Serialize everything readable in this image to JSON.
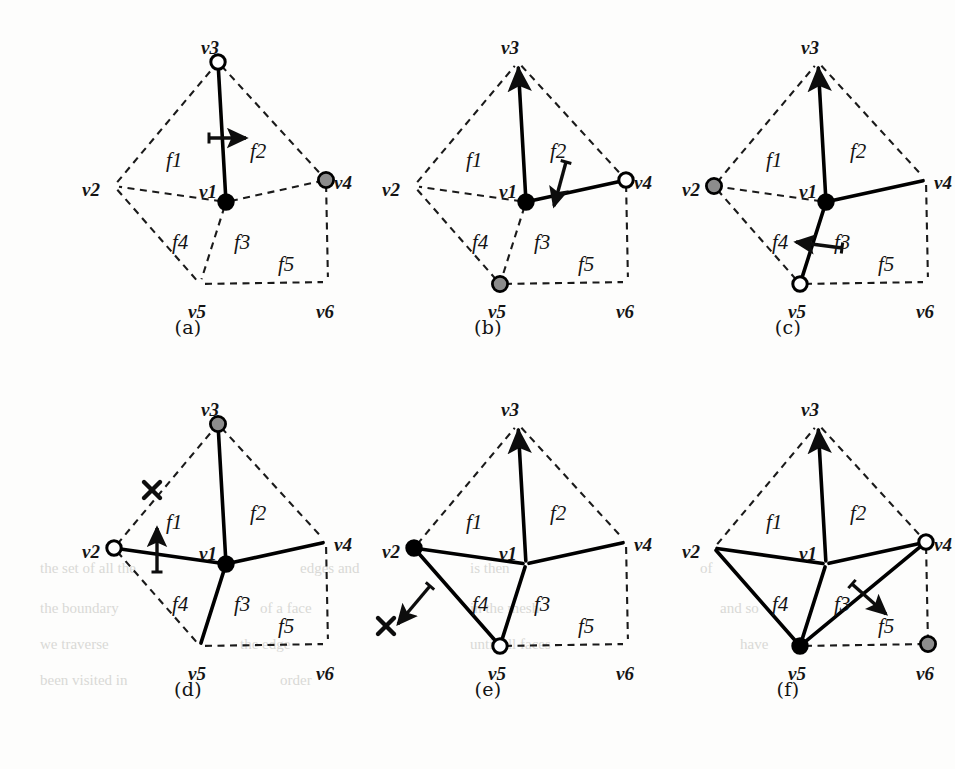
{
  "figure": {
    "vertex_names": [
      "v1",
      "v2",
      "v3",
      "v4",
      "v5",
      "v6"
    ],
    "face_names": [
      "f1",
      "f2",
      "f3",
      "f4",
      "f5"
    ],
    "colors": {
      "ink": "#141414",
      "dashed_edge": "#1a1a1a",
      "solid_edge": "#000000",
      "vertex_black": "#000000",
      "vertex_gray": "#8c8c8c",
      "vertex_white": "#ffffff",
      "background": "#fdfdfc"
    },
    "legend_semantics": {
      "black_filled": "current vertex",
      "gray_filled": "queued vertex",
      "white_open": "finished vertex",
      "dashed": "untraversed edge",
      "solid": "traversed edge",
      "arrow": "traversal direction",
      "cross": "rejected / blocked"
    },
    "geometry": {
      "v1": [
        188,
        192
      ],
      "v2": [
        76,
        176
      ],
      "v3": [
        180,
        52
      ],
      "v4": [
        288,
        170
      ],
      "v5": [
        162,
        274
      ],
      "v6": [
        290,
        272
      ]
    },
    "face_label_pos": {
      "f1": [
        128,
        140
      ],
      "f2": [
        212,
        131
      ],
      "f3": [
        196,
        222
      ],
      "f4": [
        134,
        222
      ],
      "f5": [
        240,
        244
      ]
    },
    "vertex_label_pos": {
      "v1": [
        161,
        172
      ],
      "v2": [
        44,
        170
      ],
      "v3": [
        163,
        28
      ],
      "v4": [
        296,
        163
      ],
      "v5": [
        150,
        292
      ],
      "v6": [
        278,
        292
      ]
    }
  },
  "panels": [
    {
      "id": "a",
      "caption": "(a)",
      "x": 38,
      "y": 10,
      "vertex_markers": {
        "v1": "black",
        "v2": "none",
        "v3": "white",
        "v4": "gray",
        "v5": "none",
        "v6": "none"
      },
      "solid_edges": [
        "v1-v3"
      ],
      "dashed_edges": [
        "v2-v3",
        "v3-v4",
        "v1-v2",
        "v1-v4",
        "v1-v5",
        "v2-v5",
        "v5-v6",
        "v4-v6"
      ],
      "arrow": {
        "x1": 171,
        "y1": 128,
        "x2": 208,
        "y2": 128,
        "label": "right"
      },
      "cross": null
    },
    {
      "id": "b",
      "caption": "(b)",
      "x": 338,
      "y": 10,
      "vertex_markers": {
        "v1": "black",
        "v2": "none",
        "v3": "arrowtip",
        "v4": "white",
        "v5": "gray",
        "v6": "none"
      },
      "solid_edges": [
        "v1-v3",
        "v1-v4"
      ],
      "dashed_edges": [
        "v2-v3",
        "v3-v4",
        "v1-v2",
        "v1-v5",
        "v2-v5",
        "v5-v6",
        "v4-v6"
      ],
      "arrow": {
        "x1": 228,
        "y1": 152,
        "x2": 216,
        "y2": 196,
        "label": "down"
      },
      "cross": null
    },
    {
      "id": "c",
      "caption": "(c)",
      "x": 638,
      "y": 10,
      "vertex_markers": {
        "v1": "black",
        "v2": "gray",
        "v3": "arrowtip",
        "v4": "none",
        "v5": "white",
        "v6": "none"
      },
      "solid_edges": [
        "v1-v3",
        "v1-v4",
        "v1-v5"
      ],
      "dashed_edges": [
        "v2-v3",
        "v3-v4",
        "v1-v2",
        "v2-v5",
        "v5-v6",
        "v4-v6"
      ],
      "arrow": {
        "x1": 204,
        "y1": 238,
        "x2": 158,
        "y2": 232,
        "label": "left"
      },
      "cross": null
    },
    {
      "id": "d",
      "caption": "(d)",
      "x": 38,
      "y": 372,
      "vertex_markers": {
        "v1": "black",
        "v2": "white",
        "v3": "gray",
        "v4": "none",
        "v5": "none",
        "v6": "none"
      },
      "solid_edges": [
        "v1-v3",
        "v1-v4",
        "v1-v5",
        "v1-v2"
      ],
      "dashed_edges": [
        "v2-v3",
        "v3-v4",
        "v2-v5",
        "v5-v6",
        "v4-v6"
      ],
      "arrow": {
        "x1": 119,
        "y1": 200,
        "x2": 119,
        "y2": 156,
        "label": "up"
      },
      "cross": {
        "x": 114,
        "y": 118
      }
    },
    {
      "id": "e",
      "caption": "(e)",
      "x": 338,
      "y": 372,
      "vertex_markers": {
        "v1": "none",
        "v2": "black",
        "v3": "arrowtip",
        "v4": "none",
        "v5": "white",
        "v6": "none"
      },
      "solid_edges": [
        "v1-v3",
        "v1-v4",
        "v1-v5",
        "v1-v2",
        "v2-v5"
      ],
      "dashed_edges": [
        "v2-v3",
        "v3-v4",
        "v5-v6",
        "v4-v6"
      ],
      "arrow": {
        "x1": 92,
        "y1": 214,
        "x2": 60,
        "y2": 252,
        "label": "down-left"
      },
      "cross": {
        "x": 48,
        "y": 254
      }
    },
    {
      "id": "f",
      "caption": "(f)",
      "x": 638,
      "y": 372,
      "vertex_markers": {
        "v1": "none",
        "v2": "none",
        "v3": "arrowtip",
        "v4": "white",
        "v5": "black",
        "v6": "gray"
      },
      "solid_edges": [
        "v1-v3",
        "v1-v4",
        "v1-v5",
        "v1-v2",
        "v2-v5",
        "v5-v4"
      ],
      "dashed_edges": [
        "v2-v3",
        "v3-v4",
        "v5-v6",
        "v4-v6"
      ],
      "arrow": {
        "x1": 214,
        "y1": 212,
        "x2": 248,
        "y2": 242,
        "label": "down-right"
      },
      "cross": null
    }
  ],
  "ghost_text": [
    {
      "t": "the set of all the",
      "x": 40,
      "y": 560
    },
    {
      "t": "edges and",
      "x": 300,
      "y": 560
    },
    {
      "t": "is then",
      "x": 470,
      "y": 560
    },
    {
      "t": "of",
      "x": 700,
      "y": 560
    },
    {
      "t": "the boundary",
      "x": 40,
      "y": 600
    },
    {
      "t": "of a face",
      "x": 260,
      "y": 600
    },
    {
      "t": "in the mesh",
      "x": 470,
      "y": 600
    },
    {
      "t": "and so",
      "x": 720,
      "y": 600
    },
    {
      "t": "we traverse",
      "x": 40,
      "y": 636
    },
    {
      "t": "the edge",
      "x": 240,
      "y": 636
    },
    {
      "t": "until all faces",
      "x": 470,
      "y": 636
    },
    {
      "t": "have",
      "x": 740,
      "y": 636
    },
    {
      "t": "been visited in",
      "x": 40,
      "y": 672
    },
    {
      "t": "order",
      "x": 280,
      "y": 672
    }
  ]
}
